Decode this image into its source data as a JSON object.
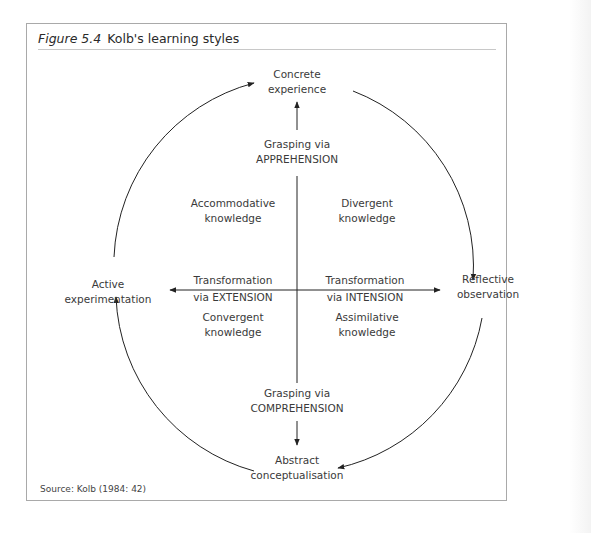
{
  "running_header": "",
  "figure": {
    "number": "Figure 5.4",
    "title": "Kolb's learning styles",
    "source": "Source: Kolb (1984: 42)"
  },
  "poles": {
    "top": [
      "Concrete",
      "experience"
    ],
    "right": [
      "Reflective",
      "observation"
    ],
    "bottom": [
      "Abstract",
      "conceptualisation"
    ],
    "left": [
      "Active",
      "experimentation"
    ]
  },
  "axes": {
    "grasping_top": [
      "Grasping via",
      "APPREHENSION"
    ],
    "grasping_bottom": [
      "Grasping via",
      "COMPREHENSION"
    ],
    "transform_left": [
      "Transformation",
      "via EXTENSION"
    ],
    "transform_right": [
      "Transformation",
      "via INTENSION"
    ]
  },
  "quadrants": {
    "top_left": [
      "Accommodative",
      "knowledge"
    ],
    "top_right": [
      "Divergent",
      "knowledge"
    ],
    "bottom_left": [
      "Convergent",
      "knowledge"
    ],
    "bottom_right": [
      "Assimilative",
      "knowledge"
    ]
  },
  "colors": {
    "line": "#222222",
    "frame": "#a9a9a9",
    "text": "#333333"
  }
}
